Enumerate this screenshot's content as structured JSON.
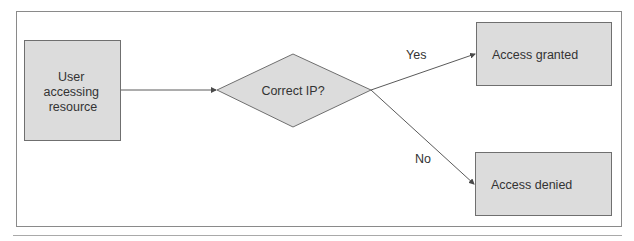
{
  "diagram": {
    "type": "flowchart",
    "colors": {
      "background": "#ffffff",
      "frame_stroke": "#8a8a8a",
      "node_fill": "#dcdcdc",
      "node_stroke": "#6f6f6f",
      "edge_stroke": "#5a5a5a",
      "text": "#333333"
    },
    "nodes": [
      {
        "id": "user",
        "shape": "rectangle",
        "lines": [
          "User",
          "accessing",
          "resource"
        ]
      },
      {
        "id": "decision",
        "shape": "diamond",
        "label": "Correct IP?"
      },
      {
        "id": "granted",
        "shape": "rectangle",
        "label": "Access granted"
      },
      {
        "id": "denied",
        "shape": "rectangle",
        "label": "Access denied"
      }
    ],
    "edges": [
      {
        "from": "user",
        "to": "decision",
        "label": ""
      },
      {
        "from": "decision",
        "to": "granted",
        "label": "Yes"
      },
      {
        "from": "decision",
        "to": "denied",
        "label": "No"
      }
    ]
  }
}
